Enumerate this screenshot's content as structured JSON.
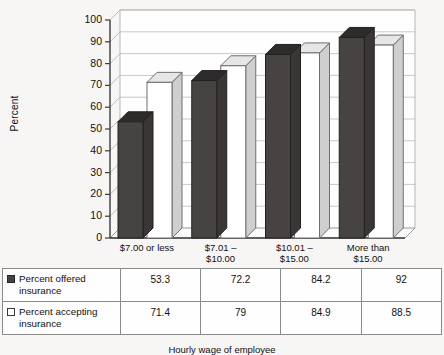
{
  "chart_data": {
    "type": "bar",
    "title": "",
    "subtitle": "",
    "xlabel": "Hourly wage of employee",
    "ylabel": "Percent",
    "ylim": [
      0,
      100
    ],
    "yticks": [
      0,
      10,
      20,
      30,
      40,
      50,
      60,
      70,
      80,
      90,
      100
    ],
    "grid": true,
    "legend_position": "table-below",
    "categories": [
      "$7.00 or less",
      "$7.01 – $10.00",
      "$10.01 – $15.00",
      "More than $15.00"
    ],
    "category_lines": [
      [
        "$7.00 or less"
      ],
      [
        "$7.01 –",
        "$10.00"
      ],
      [
        "$10.01 –",
        "$15.00"
      ],
      [
        "More than",
        "$15.00"
      ]
    ],
    "series": [
      {
        "name": "Percent offered insurance",
        "values": [
          53.3,
          72.2,
          84.2,
          92
        ],
        "labels": [
          "53.3",
          "72.2",
          "84.2",
          "92"
        ],
        "color": "#474343",
        "swatch": "filled"
      },
      {
        "name": "Percent accepting insurance",
        "values": [
          71.4,
          79,
          84.9,
          88.5
        ],
        "labels": [
          "71.4",
          "79",
          "84.9",
          "88.5"
        ],
        "color": "#ffffff",
        "swatch": "hollow"
      }
    ]
  },
  "axis": {
    "y_label": "Percent",
    "y_ticks": [
      "100",
      "90",
      "80",
      "70",
      "60",
      "50",
      "40",
      "30",
      "20",
      "10",
      "0"
    ]
  },
  "legend": {
    "series_1_line1": "Percent offered",
    "series_1_line2": "insurance",
    "series_2_line1": "Percent accepting",
    "series_2_line2": "insurance"
  },
  "table": {
    "rows": [
      {
        "label_line1": "Percent offered",
        "label_line2": "insurance",
        "swatch": "filled",
        "values": [
          "53.3",
          "72.2",
          "84.2",
          "92"
        ]
      },
      {
        "label_line1": "Percent accepting",
        "label_line2": "insurance",
        "swatch": "hollow",
        "values": [
          "71.4",
          "79",
          "84.9",
          "88.5"
        ]
      }
    ]
  },
  "footnote": "Hourly wage of employee",
  "colors": {
    "bar_dark": "#474343",
    "bar_dark_cap": "#2e2b2b",
    "bar_light": "#ffffff",
    "bar_light_cap": "#e6e6e6",
    "grid": "#c9c9c9",
    "axis": "#3c3c3c",
    "background": "#f7f6f4"
  }
}
